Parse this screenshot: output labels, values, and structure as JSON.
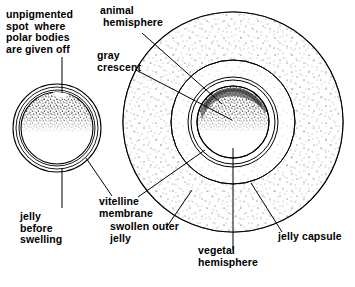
{
  "figure": {
    "bg_color": "#ffffff",
    "ink_color": "#000000"
  },
  "labels": {
    "unpigmented_spot": {
      "id": "unpigmented-spot",
      "lines": [
        "unpigmented",
        "spot  where",
        "polar bodies",
        "are given off"
      ],
      "text": "unpigmented spot where polar bodies are given off"
    },
    "animal_hemisphere": {
      "id": "animal-hemisphere",
      "lines": [
        "animal",
        " hemisphere"
      ],
      "text": "animal hemisphere"
    },
    "gray_crescent": {
      "id": "gray-crescent",
      "lines": [
        "gray",
        "crescent"
      ],
      "text": "gray crescent"
    },
    "jelly_before_swelling": {
      "id": "jelly-before-swelling",
      "lines": [
        "jelly",
        "before",
        "swelling"
      ],
      "text": "jelly before swelling"
    },
    "vitelline_membrane": {
      "id": "vitelline-membrane",
      "lines": [
        "vitelline",
        "membrane"
      ],
      "text": "vitelline membrane"
    },
    "swollen_outer_jelly": {
      "id": "swollen-outer-jelly",
      "lines": [
        "swollen outer",
        "jelly"
      ],
      "text": "swollen outer jelly"
    },
    "vegetal_hemisphere": {
      "id": "vegetal-hemisphere",
      "lines": [
        "vegetal",
        "hemisphere"
      ],
      "text": "vegetal hemisphere"
    },
    "jelly_capsule": {
      "id": "jelly-capsule",
      "lines": [
        "jelly capsule"
      ],
      "text": "jelly capsule"
    }
  },
  "diagram": {
    "small_egg": {
      "name": "egg-before-swelling",
      "center": [
        57,
        128
      ],
      "outer_jelly_radius": 44,
      "mid_jelly_radius": 41,
      "inner_jelly_radius": 38,
      "cytoplasm_radius": 36,
      "equator_y": 132,
      "pigmented": "upper (animal) hemisphere, dense stipple",
      "unpigmented": "lower (vegetal) hemisphere, blank"
    },
    "large_egg": {
      "name": "egg-after-jelly-swelling",
      "center": [
        233,
        122
      ],
      "jelly_capsule_radius": 110,
      "swollen_outer_jelly_radius": 62,
      "vitelline_membrane_radius": 45,
      "vitelline_inner_radius": 42,
      "cytoplasm_radius": 36,
      "equator_y": 131,
      "gray_crescent": "dark band along upper-right of animal pole boundary"
    }
  }
}
